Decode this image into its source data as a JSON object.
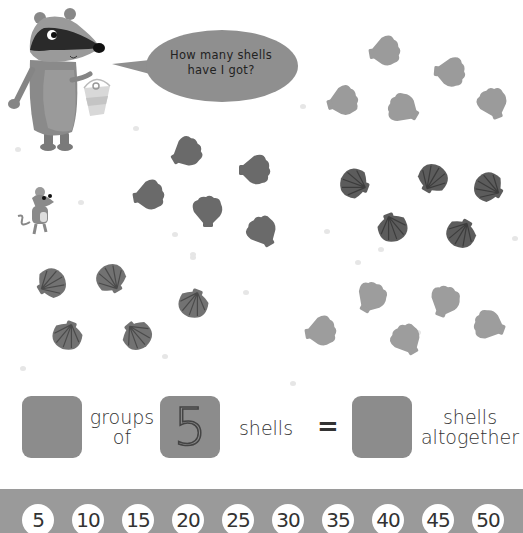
{
  "speech_bubble": {
    "line1": "How many shells",
    "line2": "have I got?"
  },
  "characters": {
    "badger": "badger-with-bucket",
    "mouse": "mouse"
  },
  "shell_groups": [
    {
      "id": "top-right",
      "count": 5,
      "style": "fan-light"
    },
    {
      "id": "middle-left",
      "count": 5,
      "style": "fan-dark"
    },
    {
      "id": "middle-right",
      "count": 5,
      "style": "scallop-dark"
    },
    {
      "id": "bottom-left",
      "count": 5,
      "style": "scallop-medium"
    },
    {
      "id": "bottom-right",
      "count": 5,
      "style": "fan-light"
    }
  ],
  "equation": {
    "groups_answer": "",
    "groups_label_line1": "groups",
    "groups_label_line2": "of",
    "group_size": "5",
    "shells_label": "shells",
    "equals": "=",
    "total_answer": "",
    "total_label_line1": "shells",
    "total_label_line2": "altogether"
  },
  "number_line": {
    "values": [
      "5",
      "10",
      "15",
      "20",
      "25",
      "30",
      "35",
      "40",
      "45",
      "50"
    ]
  },
  "colors": {
    "answer_box": "#8c8c8c",
    "band": "#9a9a9a",
    "bubble": "#8f8f8f"
  }
}
